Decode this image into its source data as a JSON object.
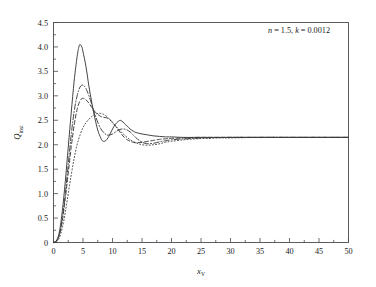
{
  "chart_data": {
    "type": "line",
    "title": "",
    "xlabel": "x_V",
    "xlabel_main": "x",
    "xlabel_sub": "V",
    "ylabel": "Q_inst",
    "ylabel_main": "Q",
    "ylabel_sub": "inst",
    "xlim": [
      0,
      50
    ],
    "ylim": [
      0,
      4.5
    ],
    "xticks": [
      0,
      5,
      10,
      15,
      20,
      25,
      30,
      35,
      40,
      45,
      50
    ],
    "yticks": [
      "0",
      "0.5",
      "1.0",
      "1.5",
      "2.0",
      "2.5",
      "3.0",
      "3.5",
      "4.0",
      "4.5"
    ],
    "ytick_values": [
      0,
      0.5,
      1.0,
      1.5,
      2.0,
      2.5,
      3.0,
      3.5,
      4.0,
      4.5
    ],
    "grid": false,
    "legend_position": "top-right",
    "annotation": "n = 1.5, k = 0.0012",
    "annotation_parts": {
      "n_label": "n",
      "n_value": "1.5",
      "k_label": "k",
      "k_value": "0.0012"
    },
    "series": [
      {
        "name": "φ = 4.00",
        "phi": 4.0,
        "style": "dotted",
        "color": "#3a3a3a",
        "points": [
          [
            0,
            0
          ],
          [
            0.5,
            0.02
          ],
          [
            1,
            0.1
          ],
          [
            1.5,
            0.3
          ],
          [
            2,
            0.62
          ],
          [
            2.5,
            1.0
          ],
          [
            3,
            1.38
          ],
          [
            3.5,
            1.72
          ],
          [
            4,
            2.0
          ],
          [
            4.5,
            2.2
          ],
          [
            5,
            2.35
          ],
          [
            5.5,
            2.45
          ],
          [
            6,
            2.52
          ],
          [
            6.5,
            2.58
          ],
          [
            7,
            2.62
          ],
          [
            7.5,
            2.64
          ],
          [
            8,
            2.64
          ],
          [
            8.5,
            2.62
          ],
          [
            9,
            2.58
          ],
          [
            9.5,
            2.52
          ],
          [
            10,
            2.45
          ],
          [
            11,
            2.32
          ],
          [
            12,
            2.2
          ],
          [
            13,
            2.1
          ],
          [
            14,
            2.04
          ],
          [
            15,
            2.0
          ],
          [
            16,
            1.99
          ],
          [
            17,
            2.0
          ],
          [
            18,
            2.02
          ],
          [
            19,
            2.05
          ],
          [
            20,
            2.07
          ],
          [
            22,
            2.1
          ],
          [
            24,
            2.12
          ],
          [
            26,
            2.13
          ],
          [
            28,
            2.14
          ],
          [
            30,
            2.14
          ],
          [
            35,
            2.15
          ],
          [
            40,
            2.15
          ],
          [
            45,
            2.15
          ],
          [
            50,
            2.15
          ]
        ]
      },
      {
        "name": "φ = 2.97",
        "phi": 2.97,
        "style": "dashed",
        "color": "#3a3a3a",
        "points": [
          [
            0,
            0
          ],
          [
            0.5,
            0.03
          ],
          [
            1,
            0.15
          ],
          [
            1.5,
            0.45
          ],
          [
            2,
            0.9
          ],
          [
            2.5,
            1.42
          ],
          [
            3,
            1.95
          ],
          [
            3.5,
            2.4
          ],
          [
            4,
            2.72
          ],
          [
            4.5,
            2.9
          ],
          [
            5,
            2.95
          ],
          [
            5.5,
            2.92
          ],
          [
            6,
            2.85
          ],
          [
            6.5,
            2.76
          ],
          [
            7,
            2.68
          ],
          [
            7.5,
            2.62
          ],
          [
            8,
            2.58
          ],
          [
            8.5,
            2.56
          ],
          [
            9,
            2.55
          ],
          [
            9.5,
            2.52
          ],
          [
            10,
            2.46
          ],
          [
            10.5,
            2.38
          ],
          [
            11,
            2.3
          ],
          [
            11.5,
            2.22
          ],
          [
            12,
            2.15
          ],
          [
            12.5,
            2.1
          ],
          [
            13,
            2.07
          ],
          [
            13.5,
            2.05
          ],
          [
            14,
            2.04
          ],
          [
            15,
            2.05
          ],
          [
            16,
            2.07
          ],
          [
            17,
            2.09
          ],
          [
            18,
            2.11
          ],
          [
            19,
            2.12
          ],
          [
            20,
            2.13
          ],
          [
            22,
            2.14
          ],
          [
            24,
            2.15
          ],
          [
            26,
            2.15
          ],
          [
            30,
            2.15
          ],
          [
            35,
            2.15
          ],
          [
            40,
            2.15
          ],
          [
            45,
            2.15
          ],
          [
            50,
            2.15
          ]
        ]
      },
      {
        "name": "φ = 2.00",
        "phi": 2.0,
        "style": "dashdot",
        "color": "#3a3a3a",
        "points": [
          [
            0,
            0
          ],
          [
            0.5,
            0.03
          ],
          [
            1,
            0.17
          ],
          [
            1.5,
            0.5
          ],
          [
            2,
            1.0
          ],
          [
            2.5,
            1.6
          ],
          [
            3,
            2.2
          ],
          [
            3.5,
            2.68
          ],
          [
            4,
            3.0
          ],
          [
            4.5,
            3.18
          ],
          [
            5,
            3.22
          ],
          [
            5.5,
            3.15
          ],
          [
            6,
            3.0
          ],
          [
            6.5,
            2.82
          ],
          [
            7,
            2.63
          ],
          [
            7.5,
            2.46
          ],
          [
            8,
            2.33
          ],
          [
            8.5,
            2.25
          ],
          [
            9,
            2.2
          ],
          [
            9.5,
            2.2
          ],
          [
            10,
            2.22
          ],
          [
            10.5,
            2.26
          ],
          [
            11,
            2.3
          ],
          [
            11.5,
            2.32
          ],
          [
            12,
            2.32
          ],
          [
            12.5,
            2.3
          ],
          [
            13,
            2.26
          ],
          [
            13.5,
            2.2
          ],
          [
            14,
            2.14
          ],
          [
            14.5,
            2.09
          ],
          [
            15,
            2.05
          ],
          [
            15.5,
            2.03
          ],
          [
            16,
            2.02
          ],
          [
            17,
            2.03
          ],
          [
            18,
            2.06
          ],
          [
            19,
            2.08
          ],
          [
            20,
            2.1
          ],
          [
            22,
            2.12
          ],
          [
            24,
            2.13
          ],
          [
            26,
            2.14
          ],
          [
            30,
            2.15
          ],
          [
            35,
            2.15
          ],
          [
            40,
            2.15
          ],
          [
            45,
            2.15
          ],
          [
            50,
            2.15
          ]
        ]
      },
      {
        "name": "φ = 1.49",
        "phi": 1.49,
        "style": "solid",
        "color": "#3a3a3a",
        "points": [
          [
            0,
            0
          ],
          [
            0.5,
            0.04
          ],
          [
            1,
            0.22
          ],
          [
            1.5,
            0.65
          ],
          [
            2,
            1.25
          ],
          [
            2.5,
            1.95
          ],
          [
            3,
            2.65
          ],
          [
            3.5,
            3.3
          ],
          [
            4,
            3.8
          ],
          [
            4.3,
            4.0
          ],
          [
            4.5,
            4.05
          ],
          [
            4.8,
            4.0
          ],
          [
            5,
            3.9
          ],
          [
            5.5,
            3.6
          ],
          [
            6,
            3.2
          ],
          [
            6.5,
            2.85
          ],
          [
            7,
            2.55
          ],
          [
            7.5,
            2.3
          ],
          [
            8,
            2.14
          ],
          [
            8.3,
            2.08
          ],
          [
            8.6,
            2.07
          ],
          [
            9,
            2.1
          ],
          [
            9.5,
            2.2
          ],
          [
            10,
            2.32
          ],
          [
            10.5,
            2.42
          ],
          [
            11,
            2.48
          ],
          [
            11.3,
            2.5
          ],
          [
            11.6,
            2.48
          ],
          [
            12,
            2.44
          ],
          [
            12.5,
            2.38
          ],
          [
            13,
            2.32
          ],
          [
            13.5,
            2.28
          ],
          [
            14,
            2.25
          ],
          [
            15,
            2.22
          ],
          [
            16,
            2.2
          ],
          [
            17,
            2.18
          ],
          [
            18,
            2.17
          ],
          [
            19,
            2.16
          ],
          [
            20,
            2.16
          ],
          [
            22,
            2.15
          ],
          [
            25,
            2.15
          ],
          [
            30,
            2.15
          ],
          [
            35,
            2.15
          ],
          [
            40,
            2.15
          ],
          [
            45,
            2.15
          ],
          [
            50,
            2.15
          ]
        ]
      }
    ]
  },
  "legend": {
    "header": "n = 1.5, k = 0.0012",
    "entries": [
      {
        "label": "φ = 4.00",
        "phi_symbol": "φ",
        "eq": "=",
        "value": "4.00",
        "style": "dotted"
      },
      {
        "label": "φ = 2.97",
        "phi_symbol": "φ",
        "eq": "=",
        "value": "2.97",
        "style": "dashed"
      },
      {
        "label": "φ = 2.00",
        "phi_symbol": "φ",
        "eq": "=",
        "value": "2.00",
        "style": "dashdot"
      },
      {
        "label": "φ = 1.49",
        "phi_symbol": "φ",
        "eq": "=",
        "value": "1.49",
        "style": "solid"
      }
    ]
  },
  "colors": {
    "curve": "#3a3a3a",
    "axis": "#4a4a4a",
    "text": "#1a1a1a",
    "background": "#ffffff"
  }
}
